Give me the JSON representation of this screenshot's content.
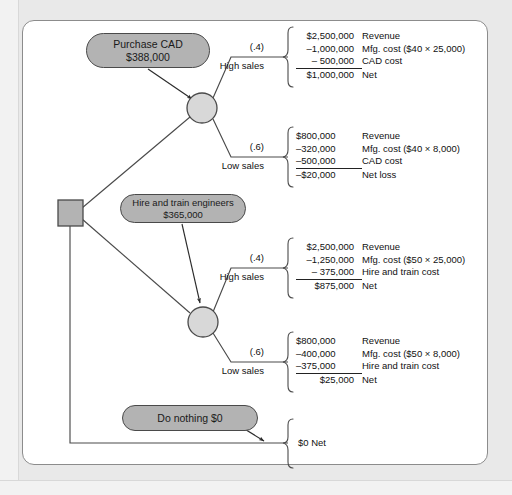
{
  "diagram": {
    "colors": {
      "node_fill": "#b3b3b3",
      "chance_fill": "#d4d4d4",
      "stroke": "#4a4a4a",
      "panel_bg": "#ffffff",
      "page_bg": "#e9e9e9"
    }
  },
  "decision_node": {
    "label": ""
  },
  "alternatives": [
    {
      "id": "purchase-cad",
      "line1": "Purchase CAD",
      "line2": "$388,000"
    },
    {
      "id": "hire-and-train",
      "line1": "Hire and train engineers",
      "line2": "$365,000"
    },
    {
      "id": "do-nothing",
      "line1": "Do nothing $0",
      "line2": ""
    }
  ],
  "branches": [
    {
      "id": "cad-high-sales",
      "probability": "(.4)",
      "name": "High sales",
      "align": "right",
      "rows": [
        {
          "num": "$2,500,000",
          "desc": "Revenue",
          "ruled": false
        },
        {
          "num": "–1,000,000",
          "desc": "Mfg. cost ($40 × 25,000)",
          "ruled": false
        },
        {
          "num": "–   500,000",
          "desc": "CAD cost",
          "ruled": true
        },
        {
          "num": "$1,000,000",
          "desc": "Net",
          "ruled": false
        }
      ]
    },
    {
      "id": "cad-low-sales",
      "probability": "(.6)",
      "name": "Low sales",
      "align": "left",
      "rows": [
        {
          "num": "$800,000",
          "desc": "Revenue",
          "ruled": false
        },
        {
          "num": "–320,000",
          "desc": "Mfg. cost ($40 × 8,000)",
          "ruled": false
        },
        {
          "num": "–500,000",
          "desc": "CAD cost",
          "ruled": true
        },
        {
          "num": "–$20,000",
          "desc": "Net loss",
          "ruled": false
        }
      ]
    },
    {
      "id": "hire-high-sales",
      "probability": "(.4)",
      "name": "High sales",
      "align": "right",
      "rows": [
        {
          "num": "$2,500,000",
          "desc": "Revenue",
          "ruled": false
        },
        {
          "num": "–1,250,000",
          "desc": "Mfg. cost ($50 × 25,000)",
          "ruled": false
        },
        {
          "num": "–   375,000",
          "desc": "Hire and train cost",
          "ruled": true
        },
        {
          "num": "$875,000",
          "desc": "Net",
          "ruled": false
        }
      ]
    },
    {
      "id": "hire-low-sales",
      "probability": "(.6)",
      "name": "Low sales",
      "align": "left",
      "rows": [
        {
          "num": "$800,000",
          "desc": "Revenue",
          "ruled": false
        },
        {
          "num": "–400,000",
          "desc": "Mfg. cost ($50 × 8,000)",
          "ruled": false
        },
        {
          "num": "–375,000",
          "desc": "Hire and train cost",
          "ruled": true
        },
        {
          "num": "$25,000",
          "desc": "Net",
          "ruled": false,
          "indent": true
        }
      ]
    }
  ],
  "do_nothing_outcome": {
    "text": "$0 Net"
  },
  "chart_data": {
    "type": "diagram",
    "subtype": "decision-tree",
    "decision_alternatives": [
      {
        "name": "Purchase CAD",
        "cost": 388000
      },
      {
        "name": "Hire and train engineers",
        "cost": 365000
      },
      {
        "name": "Do nothing",
        "cost": 0
      }
    ],
    "outcomes": [
      {
        "alternative": "Purchase CAD",
        "state": "High sales",
        "probability": 0.4,
        "revenue": 2500000,
        "mfg_cost": -1000000,
        "other_cost": -500000,
        "other_cost_label": "CAD cost",
        "net": 1000000
      },
      {
        "alternative": "Purchase CAD",
        "state": "Low sales",
        "probability": 0.6,
        "revenue": 800000,
        "mfg_cost": -320000,
        "other_cost": -500000,
        "other_cost_label": "CAD cost",
        "net": -20000
      },
      {
        "alternative": "Hire and train engineers",
        "state": "High sales",
        "probability": 0.4,
        "revenue": 2500000,
        "mfg_cost": -1250000,
        "other_cost": -375000,
        "other_cost_label": "Hire and train cost",
        "net": 875000
      },
      {
        "alternative": "Hire and train engineers",
        "state": "Low sales",
        "probability": 0.6,
        "revenue": 800000,
        "mfg_cost": -400000,
        "other_cost": -375000,
        "other_cost_label": "Hire and train cost",
        "net": 25000
      },
      {
        "alternative": "Do nothing",
        "state": "",
        "probability": null,
        "net": 0
      }
    ],
    "unit_costs": {
      "cad_per_unit": 40,
      "hire_per_unit": 50
    },
    "volumes": {
      "high_sales_units": 25000,
      "low_sales_units": 8000
    }
  }
}
